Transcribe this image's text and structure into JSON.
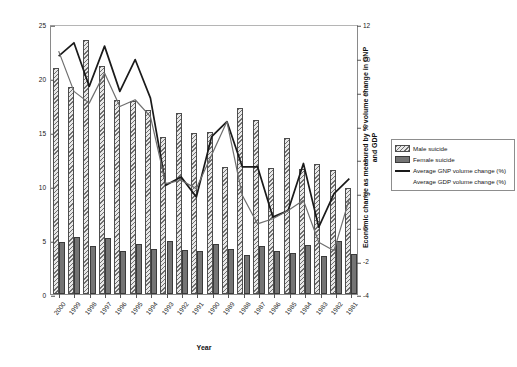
{
  "axes": {
    "x_title": "Year",
    "y_left_title": "Rate of suicide per 100,000 population",
    "y_right_title_line1": "Economic change as measured by % volume change in GNP",
    "y_right_title_line2": "and GDP",
    "y_left_ticks": [
      "0",
      "5",
      "10",
      "15",
      "20",
      "25"
    ],
    "y_right_ticks": [
      "-4",
      "-2",
      "0",
      "2",
      "4",
      "6",
      "8",
      "10",
      "12"
    ]
  },
  "legend": {
    "items": [
      {
        "label": "Male suicide",
        "marker": "hatched-bar-swatch"
      },
      {
        "label": "Female suicide",
        "marker": "solid-gray-bar-swatch"
      },
      {
        "label": "Average GNP volume change (%)",
        "marker": "black-line-swatch"
      },
      {
        "label": "Average GDP volume change (%)",
        "marker": "gray-line-swatch"
      }
    ]
  },
  "chart_data": {
    "type": "bar",
    "title": "",
    "xlabel": "Year",
    "ylabel": "Rate of suicide per 100,000 population",
    "ylabel_secondary": "Economic change as measured by % volume change in GNP and GDP",
    "grid": false,
    "legend_position": "right",
    "ylim": [
      0,
      25
    ],
    "ylim_secondary": [
      -4,
      12
    ],
    "categories": [
      "2000",
      "1999",
      "1998",
      "1997",
      "1996",
      "1995",
      "1994",
      "1993",
      "1992",
      "1991",
      "1990",
      "1989",
      "1988",
      "1987",
      "1986",
      "1985",
      "1984",
      "1983",
      "1982",
      "1981"
    ],
    "series": [
      {
        "name": "Male suicide",
        "axis": "left",
        "type": "bar",
        "values": [
          20.9,
          19.2,
          23.5,
          21.1,
          18.0,
          17.9,
          17.0,
          14.5,
          16.8,
          14.9,
          15.0,
          11.8,
          17.2,
          16.1,
          11.7,
          14.4,
          11.6,
          12.0,
          11.5,
          9.8
        ]
      },
      {
        "name": "Female suicide",
        "axis": "left",
        "type": "bar",
        "values": [
          4.8,
          5.3,
          4.4,
          5.2,
          4.0,
          4.6,
          4.2,
          4.9,
          4.1,
          4.0,
          4.6,
          4.2,
          3.6,
          4.4,
          4.0,
          3.8,
          4.5,
          3.5,
          4.9,
          3.7
        ]
      },
      {
        "name": "Average GNP volume change (%)",
        "axis": "right",
        "type": "line",
        "values": [
          10.2,
          11.0,
          8.4,
          10.8,
          8.1,
          10.0,
          7.7,
          2.5,
          3.0,
          1.8,
          5.4,
          6.3,
          3.6,
          3.6,
          0.6,
          1.0,
          3.8,
          0.0,
          2.0,
          2.9
        ]
      },
      {
        "name": "Average GDP volume change (%)",
        "axis": "right",
        "type": "line",
        "values": [
          10.5,
          8.1,
          7.4,
          9.2,
          7.2,
          7.6,
          6.6,
          2.6,
          2.8,
          2.3,
          4.3,
          6.3,
          1.9,
          0.2,
          0.5,
          1.0,
          1.6,
          -0.9,
          -1.4,
          1.7
        ]
      }
    ]
  }
}
